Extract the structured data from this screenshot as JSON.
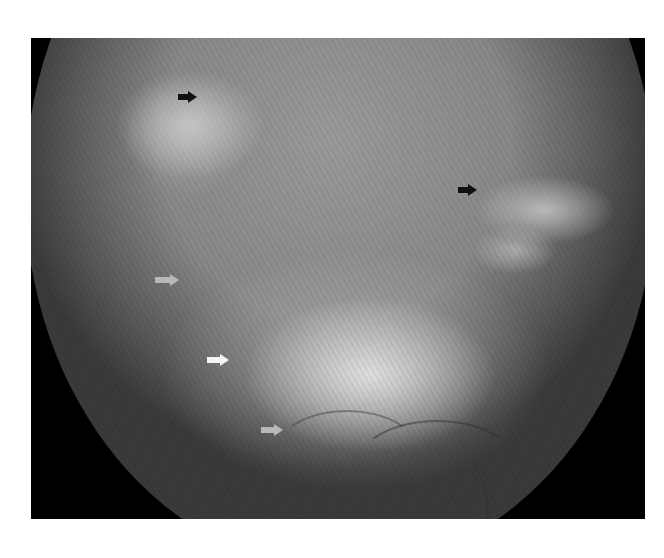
{
  "image": {
    "description": "Grayscale fundus photograph with marker arrows",
    "frame_color": "#000000",
    "background_color": "#ffffff"
  },
  "arrows": [
    {
      "id": "arrow-black-1",
      "color": "black",
      "hex": "#111111",
      "x": 178,
      "y": 97
    },
    {
      "id": "arrow-black-2",
      "color": "black",
      "hex": "#111111",
      "x": 460,
      "y": 190
    },
    {
      "id": "arrow-gray-1",
      "color": "gray",
      "hex": "#b8b8b8",
      "x": 155,
      "y": 280
    },
    {
      "id": "arrow-white-1",
      "color": "white",
      "hex": "#f4f4f4",
      "x": 207,
      "y": 360
    },
    {
      "id": "arrow-gray-2",
      "color": "gray",
      "hex": "#b8b8b8",
      "x": 261,
      "y": 430
    }
  ]
}
